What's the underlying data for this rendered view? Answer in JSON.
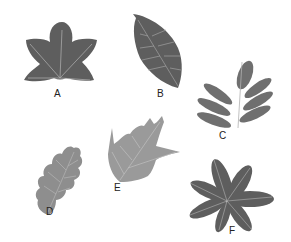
{
  "diagram": {
    "colors": {
      "background": "#ffffff",
      "dark_leaf": "#5e5e5e",
      "medium_leaf": "#6f6f6f",
      "light_leaf": "#8e8e8e",
      "lighter_leaf": "#9a9a9a",
      "vein": "#b8b8b8",
      "label": "#222222"
    },
    "leaves": [
      {
        "id": "A",
        "label": "A",
        "description": "palmate lobed leaf (sweetgum/maple-like)"
      },
      {
        "id": "B",
        "label": "B",
        "description": "simple ovate leaf with pinnate veins"
      },
      {
        "id": "C",
        "label": "C",
        "description": "pinnately compound leaf"
      },
      {
        "id": "D",
        "label": "D",
        "description": "lobed oak leaf"
      },
      {
        "id": "E",
        "label": "E",
        "description": "pointed-lobed leaf (red oak-like)"
      },
      {
        "id": "F",
        "label": "F",
        "description": "palmately compound leaf (horse chestnut-like)"
      }
    ]
  }
}
